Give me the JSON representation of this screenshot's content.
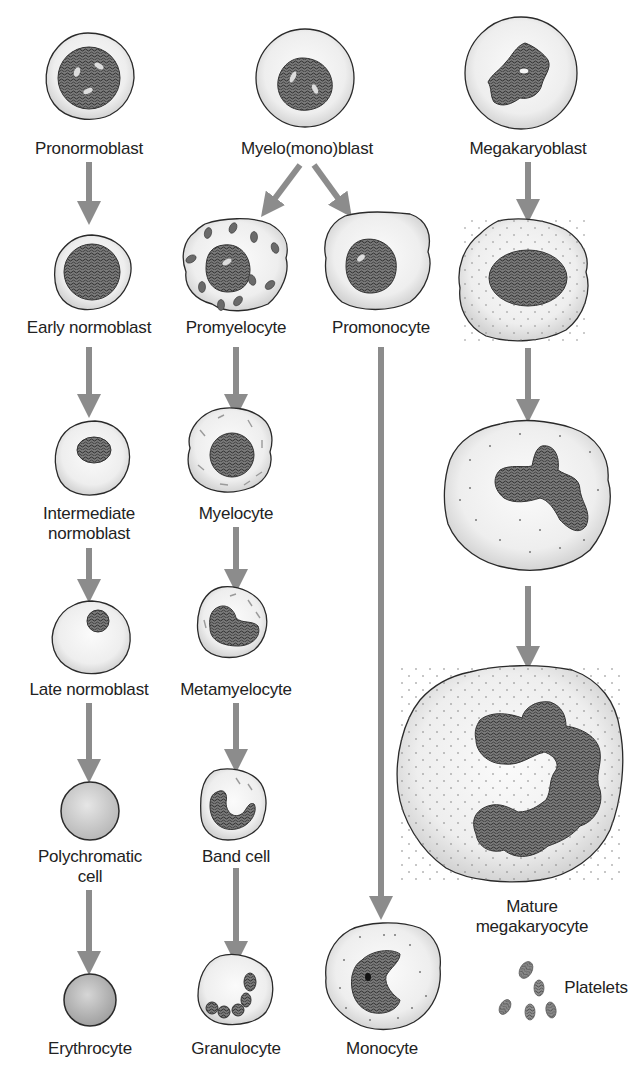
{
  "colors": {
    "arrow": "#8c8c8c",
    "outline": "#2a2a2a",
    "cytoplasm": "#efefef",
    "nucleus": "#5a5a5a",
    "text": "#222222"
  },
  "lineages": [
    {
      "name": "erythroid",
      "stages": [
        "Pronormoblast",
        "Early normoblast",
        "Intermediate normoblast",
        "Late normoblast",
        "Polychromatic cell",
        "Erythrocyte"
      ]
    },
    {
      "name": "granulocytic",
      "stages": [
        "Myelo(mono)blast",
        "Promyelocyte",
        "Myelocyte",
        "Metamyelocyte",
        "Band cell",
        "Granulocyte"
      ]
    },
    {
      "name": "monocytic",
      "stages": [
        "Myelo(mono)blast",
        "Promonocyte",
        "Monocyte"
      ]
    },
    {
      "name": "megakaryocytic",
      "stages": [
        "Megakaryoblast",
        "Mature megakaryocyte",
        "Platelets"
      ]
    }
  ],
  "labels": {
    "pronormoblast": "Pronormoblast",
    "early_normoblast": "Early normoblast",
    "intermediate_normoblast_1": "Intermediate",
    "intermediate_normoblast_2": "normoblast",
    "late_normoblast": "Late normoblast",
    "polychromatic_1": "Polychromatic",
    "polychromatic_2": "cell",
    "erythrocyte": "Erythrocyte",
    "myelomonoblast": "Myelo(mono)blast",
    "promyelocyte": "Promyelocyte",
    "myelocyte": "Myelocyte",
    "metamyelocyte": "Metamyelocyte",
    "band_cell": "Band cell",
    "granulocyte": "Granulocyte",
    "promonocyte": "Promonocyte",
    "monocyte": "Monocyte",
    "megakaryoblast": "Megakaryoblast",
    "mature_megakaryocyte_1": "Mature",
    "mature_megakaryocyte_2": "megakaryocyte",
    "platelets": "Platelets"
  }
}
